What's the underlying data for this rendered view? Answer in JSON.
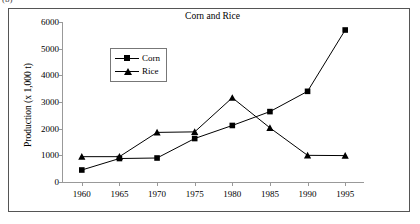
{
  "panel_label": "(b)",
  "chart_data": {
    "type": "line",
    "title": "Corn and Rice",
    "xlabel": "",
    "ylabel": "Production (x 1,000 t)",
    "categories": [
      1960,
      1965,
      1970,
      1975,
      1980,
      1985,
      1990,
      1995
    ],
    "xtick_labels": [
      "1960",
      "1965",
      "1970",
      "1975",
      "1980",
      "1985",
      "1990",
      "1995"
    ],
    "ytick_labels": [
      "0",
      "1000",
      "2000",
      "3000",
      "4000",
      "5000",
      "6000"
    ],
    "ytick_values": [
      0,
      1000,
      2000,
      3000,
      4000,
      5000,
      6000
    ],
    "ylim": [
      0,
      6000
    ],
    "xlim": [
      1957.5,
      1997.5
    ],
    "grid": false,
    "legend_position": "upper-left-inside",
    "series": [
      {
        "name": "Corn",
        "marker": "square",
        "color": "#000000",
        "values": [
          450,
          880,
          900,
          1630,
          2120,
          2640,
          3400,
          5700
        ]
      },
      {
        "name": "Rice",
        "marker": "triangle",
        "color": "#000000",
        "values": [
          950,
          950,
          1860,
          1880,
          3160,
          2030,
          1000,
          990
        ]
      }
    ]
  }
}
